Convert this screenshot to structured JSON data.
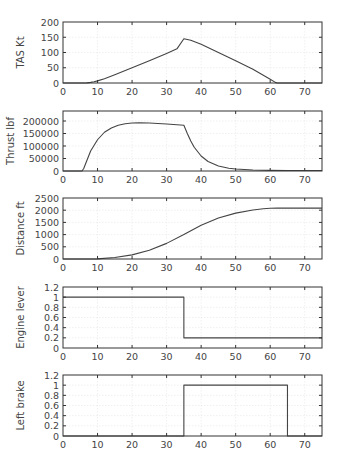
{
  "chart_data": [
    {
      "type": "line",
      "title": "",
      "xlabel": "",
      "ylabel": "TAS Kt",
      "xlim": [
        0,
        75
      ],
      "ylim": [
        0,
        200
      ],
      "xticks": [
        0,
        10,
        20,
        30,
        40,
        50,
        60,
        70
      ],
      "yticks": [
        0,
        50,
        100,
        150,
        200
      ],
      "ytick_labels": [
        "0",
        "50",
        "100",
        "150",
        "200"
      ],
      "grid": true,
      "series": [
        {
          "name": "TAS",
          "x": [
            0,
            6,
            7,
            8,
            9,
            10,
            12,
            15,
            20,
            25,
            30,
            33,
            35,
            37,
            40,
            45,
            50,
            55,
            60,
            61.5,
            62,
            75
          ],
          "y": [
            0,
            0,
            0.5,
            2,
            4,
            7,
            14,
            27,
            50,
            73,
            97,
            112,
            145,
            140,
            127,
            100,
            73,
            45,
            12,
            2,
            0,
            0
          ]
        }
      ]
    },
    {
      "type": "line",
      "title": "",
      "xlabel": "",
      "ylabel": "Thrust lbf",
      "xlim": [
        0,
        75
      ],
      "ylim": [
        0,
        240000
      ],
      "xticks": [
        0,
        10,
        20,
        30,
        40,
        50,
        60,
        70
      ],
      "yticks": [
        0,
        50000,
        100000,
        150000,
        200000
      ],
      "ytick_labels": [
        "0",
        "50000",
        "100000",
        "150000",
        "200000"
      ],
      "grid": true,
      "series": [
        {
          "name": "Thrust",
          "x": [
            0,
            5.5,
            6,
            7,
            8,
            10,
            12,
            14,
            16,
            18,
            20,
            22,
            25,
            30,
            35,
            36,
            37,
            38,
            40,
            42,
            45,
            48,
            50,
            55,
            60,
            65,
            70,
            75
          ],
          "y": [
            0,
            0,
            10000,
            45000,
            80000,
            125000,
            155000,
            172000,
            183000,
            189000,
            192000,
            193000,
            192000,
            188000,
            183000,
            150000,
            120000,
            95000,
            60000,
            38000,
            20000,
            11000,
            8000,
            4000,
            2500,
            2000,
            2000,
            2000
          ]
        }
      ]
    },
    {
      "type": "line",
      "title": "",
      "xlabel": "",
      "ylabel": "Distance ft",
      "xlim": [
        0,
        75
      ],
      "ylim": [
        0,
        2500
      ],
      "xticks": [
        0,
        10,
        20,
        30,
        40,
        50,
        60,
        70
      ],
      "yticks": [
        0,
        500,
        1000,
        1500,
        2000,
        2500
      ],
      "ytick_labels": [
        "0",
        "500",
        "1000",
        "1500",
        "2000",
        "2500"
      ],
      "grid": true,
      "series": [
        {
          "name": "Distance",
          "x": [
            0,
            6,
            10,
            15,
            20,
            25,
            30,
            35,
            40,
            45,
            50,
            55,
            58,
            60,
            62,
            75
          ],
          "y": [
            0,
            0,
            5,
            60,
            170,
            360,
            640,
            1000,
            1380,
            1680,
            1880,
            2010,
            2060,
            2080,
            2085,
            2085
          ]
        }
      ]
    },
    {
      "type": "line",
      "title": "",
      "xlabel": "",
      "ylabel": "Engine lever",
      "xlim": [
        0,
        75
      ],
      "ylim": [
        0,
        1.2
      ],
      "xticks": [
        0,
        10,
        20,
        30,
        40,
        50,
        60,
        70
      ],
      "yticks": [
        0,
        0.2,
        0.4,
        0.6,
        0.8,
        1,
        1.2
      ],
      "ytick_labels": [
        "0",
        "0.2",
        "0.4",
        "0.6",
        "0.8",
        "1",
        "1.2"
      ],
      "grid": true,
      "series": [
        {
          "name": "Engine lever",
          "x": [
            0,
            35,
            35,
            75
          ],
          "y": [
            1,
            1,
            0.2,
            0.2
          ]
        }
      ]
    },
    {
      "type": "line",
      "title": "",
      "xlabel": "",
      "ylabel": "Left brake",
      "xlim": [
        0,
        75
      ],
      "ylim": [
        0,
        1.2
      ],
      "xticks": [
        0,
        10,
        20,
        30,
        40,
        50,
        60,
        70
      ],
      "yticks": [
        0,
        0.2,
        0.4,
        0.6,
        0.8,
        1,
        1.2
      ],
      "ytick_labels": [
        "0",
        "0.2",
        "0.4",
        "0.6",
        "0.8",
        "1",
        "1.2"
      ],
      "grid": true,
      "series": [
        {
          "name": "Left brake",
          "x": [
            0,
            35,
            35,
            65,
            65,
            75
          ],
          "y": [
            0,
            0,
            1,
            1,
            0,
            0
          ]
        }
      ]
    }
  ],
  "colors": {
    "line": "#444444",
    "frame": "#333333",
    "grid": "#e6e6e6",
    "text": "#444444"
  }
}
